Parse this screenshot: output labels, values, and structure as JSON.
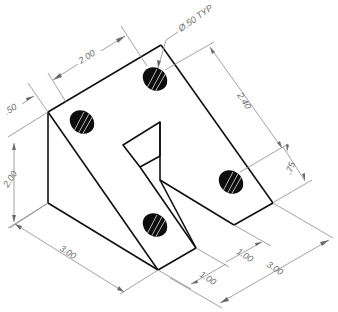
{
  "drawing": {
    "title": "Isometric angle bracket with slot",
    "colors": {
      "object_line": "#111111",
      "dimension_line": "#8a8a8a",
      "hole_fill": "#0d0d0d",
      "background": "#ffffff"
    },
    "dimensions": {
      "hole_callout": "Ø.50 TYP",
      "top_width": "2.00",
      "top_offset": ".50",
      "height_left": "2.00",
      "depth_right": "2.40",
      "hole_offset_right": ".75",
      "length_bottom_left": "3.00",
      "slot_width": "1.00",
      "slot_offset": "1.00",
      "width_bottom_right": "3.00"
    },
    "holes": 4
  }
}
